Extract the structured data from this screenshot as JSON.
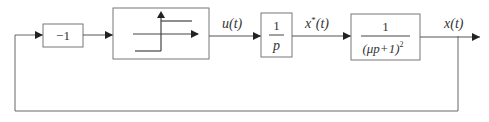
{
  "diagram": {
    "type": "control-system-block-diagram",
    "blocks": {
      "gain": {
        "label": "−1"
      },
      "relay": {
        "label": "relay nonlinearity (ideal sign)"
      },
      "integrator": {
        "numerator": "1",
        "denominator": "p"
      },
      "plant": {
        "numerator": "1",
        "denominator": "(μp+1)",
        "exponent": "2"
      }
    },
    "signals": {
      "u": "u(t)",
      "xstar_base": "x",
      "xstar_sup": "*",
      "xstar_arg": "(t)",
      "x": "x(t)"
    },
    "colors": {
      "line": "#555555",
      "block_border": "#666666",
      "text": "#333333"
    }
  }
}
